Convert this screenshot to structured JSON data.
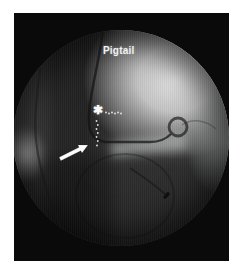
{
  "photo": {
    "labels": {
      "catheter": "Pigtail",
      "asterisk": "✱"
    },
    "icons": {
      "arrow": "white-arrow-up-right-icon",
      "dotted_line": "white-dotted-guideline",
      "pigtail_loop": "pigtail-catheter-loop"
    },
    "colors": {
      "margin_white": "#ffffff",
      "film_black": "#0a0a0a",
      "field_gray": "#3d3d3d",
      "contrast_bright": "#d9d9d9",
      "annotation_white": "#f5f5f5"
    }
  }
}
